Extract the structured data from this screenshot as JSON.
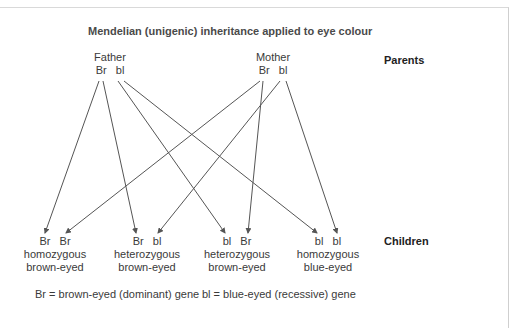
{
  "title": "Mendelian (unigenic) inheritance applied to eye colour",
  "row_labels": {
    "parents": "Parents",
    "children": "Children"
  },
  "parents": [
    {
      "name": "Father",
      "genes": "Br   bl"
    },
    {
      "name": "Mother",
      "genes": "Br   bl"
    }
  ],
  "children": [
    {
      "genes": "Br   Br",
      "zygosity": "homozygous",
      "phenotype": "brown-eyed"
    },
    {
      "genes": "Br   bl",
      "zygosity": "heterozygous",
      "phenotype": "brown-eyed"
    },
    {
      "genes": "bl   Br",
      "zygosity": "heterozygous",
      "phenotype": "brown-eyed"
    },
    {
      "genes": "bl   bl",
      "zygosity": "homozygous",
      "phenotype": "blue-eyed"
    }
  ],
  "legend": {
    "dominant": "Br = brown-eyed (dominant) gene",
    "recessive": "bl = blue-eyed (recessive) gene"
  },
  "connections": [
    {
      "from": "Father Br",
      "to": "child 1 Br (left)"
    },
    {
      "from": "Father Br",
      "to": "child 2 Br (left)"
    },
    {
      "from": "Father bl",
      "to": "child 3 bl (left)"
    },
    {
      "from": "Father bl",
      "to": "child 4 bl (left)"
    },
    {
      "from": "Mother Br",
      "to": "child 1 Br (right)"
    },
    {
      "from": "Mother Br",
      "to": "child 3 Br (right)"
    },
    {
      "from": "Mother bl",
      "to": "child 2 bl (right)"
    },
    {
      "from": "Mother bl",
      "to": "child 4 bl (right)"
    }
  ],
  "colors": {
    "line": "#555555",
    "border": "#d0d0d0",
    "text": "#333333"
  }
}
